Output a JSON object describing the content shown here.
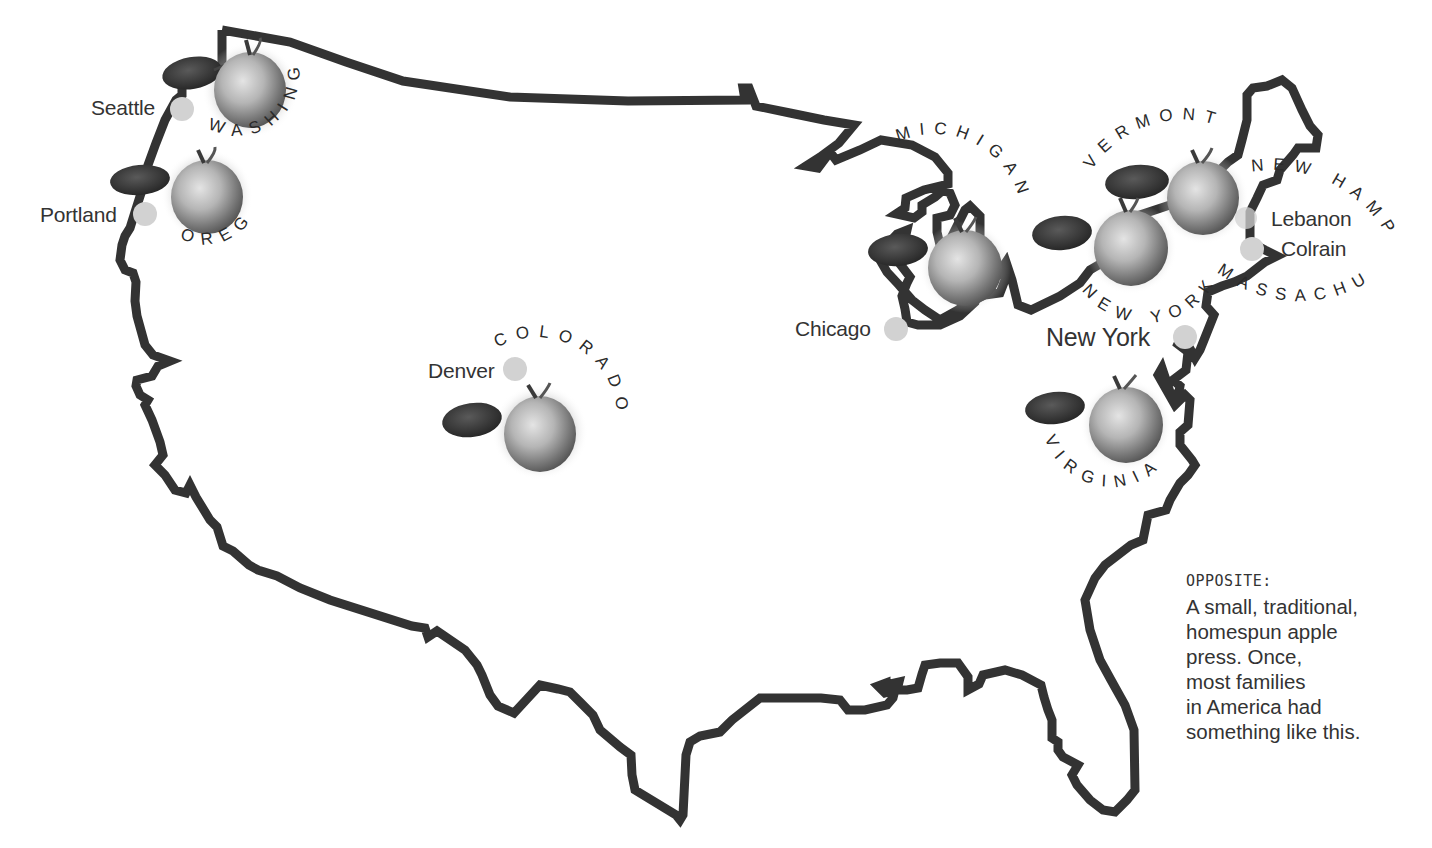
{
  "map": {
    "title": "United States apple-growing regions",
    "outline_color": "#333333",
    "city_dot_color": "#cfcfcf",
    "cities": [
      {
        "name": "Seattle",
        "dot": [
          182,
          109
        ],
        "label_pos": [
          91,
          96
        ]
      },
      {
        "name": "Portland",
        "dot": [
          145,
          214
        ],
        "label_pos": [
          40,
          203
        ]
      },
      {
        "name": "Denver",
        "dot": [
          515,
          369
        ],
        "label_pos": [
          428,
          359
        ]
      },
      {
        "name": "Chicago",
        "dot": [
          896,
          329
        ],
        "label_pos": [
          795,
          317
        ]
      },
      {
        "name": "New York",
        "dot": [
          1185,
          337
        ],
        "label_pos": [
          1046,
          325
        ]
      },
      {
        "name": "Lebanon",
        "dot": [
          1246,
          218
        ],
        "label_pos": [
          1271,
          207
        ]
      },
      {
        "name": "Colrain",
        "dot": [
          1252,
          249
        ],
        "label_pos": [
          1281,
          237
        ]
      }
    ],
    "states": [
      {
        "name": "WASHINGTON"
      },
      {
        "name": "OREGON"
      },
      {
        "name": "COLORADO"
      },
      {
        "name": "MICHIGAN"
      },
      {
        "name": "VERMONT"
      },
      {
        "name": "NEW HAMPSHIRE"
      },
      {
        "name": "NEW YORK"
      },
      {
        "name": "MASSACHUSETTS"
      },
      {
        "name": "VIRGINIA"
      }
    ],
    "apples": [
      {
        "region": "Washington",
        "cx": 250,
        "cy": 90
      },
      {
        "region": "Oregon",
        "cx": 207,
        "cy": 195
      },
      {
        "region": "Colorado",
        "cx": 540,
        "cy": 432
      },
      {
        "region": "Michigan",
        "cx": 965,
        "cy": 267
      },
      {
        "region": "Vermont",
        "cx": 1203,
        "cy": 198
      },
      {
        "region": "New York",
        "cx": 1131,
        "cy": 248
      },
      {
        "region": "Virginia",
        "cx": 1126,
        "cy": 425
      }
    ]
  },
  "caption": {
    "heading": "OPPOSITE:",
    "lines": [
      "A small, traditional,",
      "homespun apple",
      "press. Once,",
      "most families",
      "in America had",
      "something like this."
    ]
  }
}
